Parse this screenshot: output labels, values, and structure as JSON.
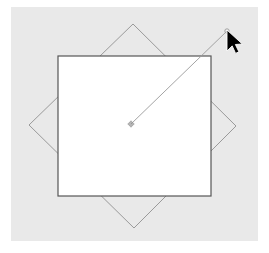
{
  "app": {
    "title": "Vector Canvas",
    "tool_name": "rotate-tool",
    "page_background": "#ffffff"
  },
  "canvas": {
    "name": "drawing-canvas",
    "background_color": "#e9e9e9",
    "x": 11,
    "y": 7,
    "width": 247,
    "height": 234
  },
  "shapes": {
    "rectangle": {
      "label": "rectangle-shape",
      "x": 58,
      "y": 56,
      "width": 153,
      "height": 140,
      "fill": "#ffffff",
      "stroke": "#565656",
      "stroke_width": 1.2
    },
    "rotation_preview": {
      "label": "rotation-preview-outline",
      "points": "133,24 236,126 134,228 29,125",
      "fill": "none",
      "stroke": "#9a9a9a",
      "stroke_width": 1
    }
  },
  "handles": {
    "center_handle": {
      "label": "rotation-center-handle",
      "cx": 131,
      "cy": 124,
      "radius": 2.2,
      "color": "#8d8d8d"
    },
    "rotation_handle": {
      "label": "rotation-grab-handle",
      "cx": 227,
      "cy": 31,
      "radius": 2.2,
      "color": "#9a9a9a"
    },
    "handle_line": {
      "label": "rotation-handle-line",
      "x1": 131,
      "y1": 124,
      "x2": 227,
      "y2": 31,
      "stroke": "#9a9a9a",
      "stroke_width": 0.9
    }
  },
  "cursor": {
    "label": "mouse-pointer",
    "x": 227,
    "y": 30,
    "fill": "#000000",
    "outline": "#ffffff"
  }
}
